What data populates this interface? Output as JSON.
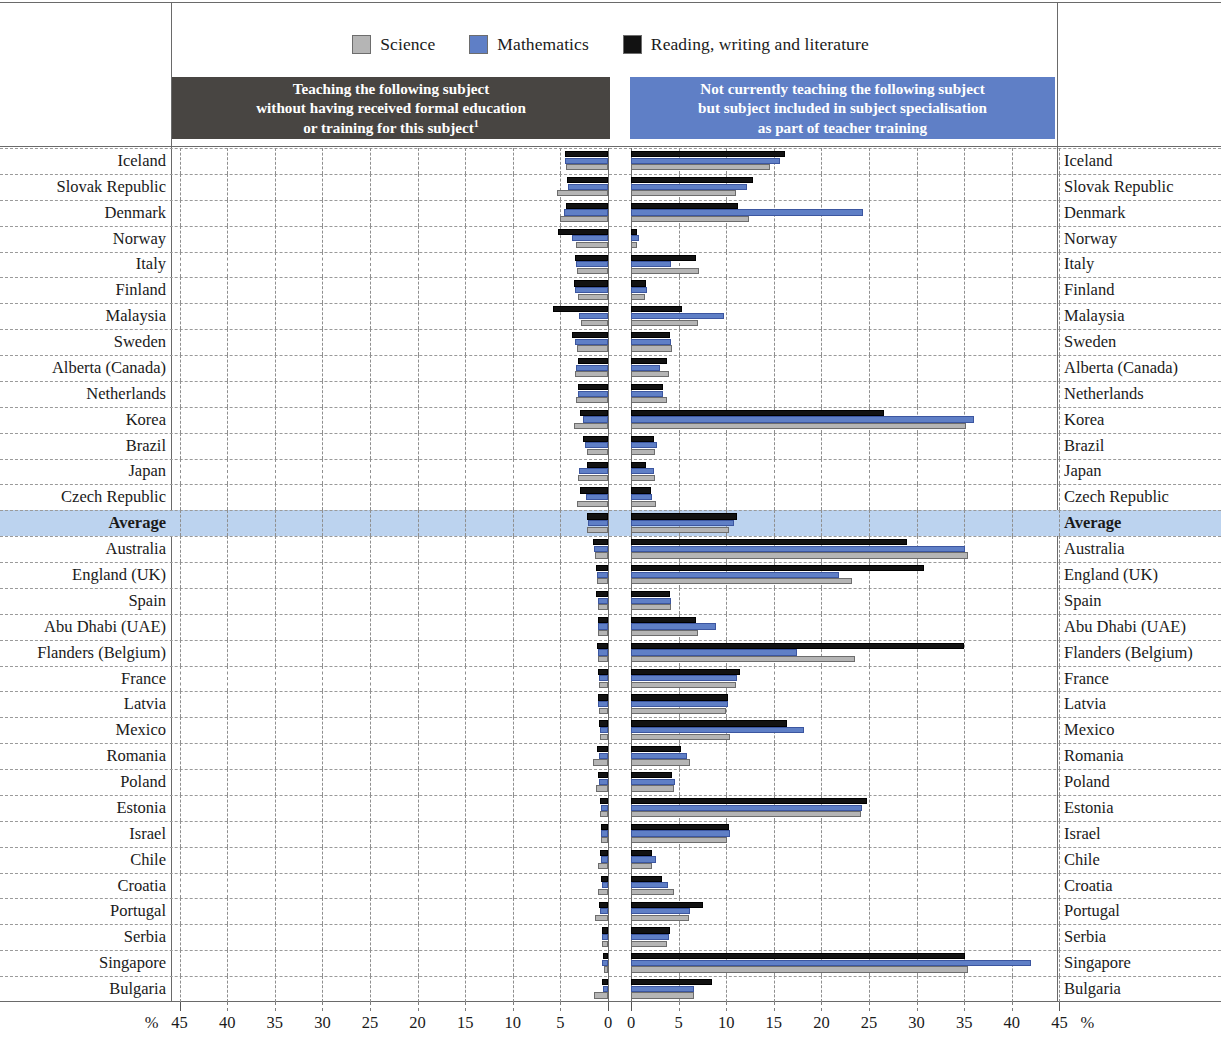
{
  "legend": {
    "items": [
      {
        "label": "Science",
        "color": "#b5b5b5",
        "key": "science"
      },
      {
        "label": "Mathematics",
        "color": "#5f7fc6",
        "key": "mathematics"
      },
      {
        "label": "Reading, writing and literature",
        "color": "#121212",
        "key": "reading"
      }
    ]
  },
  "panels": {
    "left": {
      "title_lines": [
        "Teaching the following subject",
        "without having received formal education",
        "or training for this subject"
      ],
      "footnote_marker": "1",
      "background": "#484542"
    },
    "right": {
      "title_lines": [
        "Not currently teaching the following subject",
        "but subject included in subject specialisation",
        "as part of teacher training"
      ],
      "background": "#5f7fc6"
    }
  },
  "axis": {
    "left_ticks": [
      45,
      40,
      35,
      30,
      25,
      20,
      15,
      10,
      5,
      0
    ],
    "right_ticks": [
      0,
      5,
      10,
      15,
      20,
      25,
      30,
      35,
      40,
      45
    ],
    "unit_label": "%",
    "max": 45,
    "left_zero_px": 608,
    "right_zero_px": 631,
    "px_per_unit": 9.52
  },
  "highlight_row": "Average",
  "chart_data": {
    "type": "bar",
    "orientation": "horizontal",
    "layout": "bidirectional-paired-panels",
    "xlabel": "%",
    "ylabel": "",
    "xlim": [
      0,
      45
    ],
    "grid": true,
    "legend_position": "top-center",
    "categories": [
      "Iceland",
      "Slovak Republic",
      "Denmark",
      "Norway",
      "Italy",
      "Finland",
      "Malaysia",
      "Sweden",
      "Alberta (Canada)",
      "Netherlands",
      "Korea",
      "Brazil",
      "Japan",
      "Czech Republic",
      "Average",
      "Australia",
      "England (UK)",
      "Spain",
      "Abu Dhabi (UAE)",
      "Flanders (Belgium)",
      "France",
      "Latvia",
      "Mexico",
      "Romania",
      "Poland",
      "Estonia",
      "Israel",
      "Chile",
      "Croatia",
      "Portugal",
      "Serbia",
      "Singapore",
      "Bulgaria"
    ],
    "series": [
      {
        "name": "Reading, writing and literature",
        "panel": "left",
        "color": "#121212",
        "values": [
          4.5,
          4.3,
          4.4,
          5.2,
          3.5,
          3.6,
          5.8,
          3.8,
          3.2,
          3.1,
          2.9,
          2.6,
          2.2,
          2.9,
          2.2,
          1.6,
          1.3,
          1.3,
          1.1,
          1.2,
          1.0,
          1.1,
          0.9,
          1.2,
          1.0,
          0.8,
          0.7,
          0.8,
          0.7,
          0.9,
          0.6,
          0.5,
          0.6
        ]
      },
      {
        "name": "Mathematics",
        "panel": "left",
        "color": "#5f7fc6",
        "values": [
          4.5,
          4.2,
          4.6,
          3.8,
          3.4,
          3.5,
          3.0,
          3.5,
          3.4,
          3.2,
          2.6,
          2.4,
          3.0,
          2.3,
          2.1,
          1.5,
          1.2,
          1.1,
          1.0,
          1.0,
          0.9,
          1.0,
          0.8,
          0.9,
          0.9,
          0.7,
          0.7,
          0.7,
          0.6,
          0.8,
          0.6,
          0.6,
          0.5
        ]
      },
      {
        "name": "Science",
        "panel": "left",
        "color": "#b5b5b5",
        "values": [
          4.4,
          5.4,
          5.0,
          3.4,
          3.3,
          3.2,
          2.8,
          3.3,
          3.5,
          3.4,
          3.6,
          2.2,
          3.1,
          3.3,
          2.2,
          1.4,
          1.2,
          1.0,
          1.0,
          1.1,
          0.9,
          0.9,
          0.8,
          1.6,
          1.3,
          0.8,
          0.7,
          1.0,
          1.0,
          1.4,
          0.6,
          0.4,
          1.5
        ]
      },
      {
        "name": "Reading, writing and literature",
        "panel": "right",
        "color": "#121212",
        "values": [
          16.2,
          12.8,
          11.2,
          0.6,
          6.8,
          1.6,
          5.4,
          4.1,
          3.8,
          3.4,
          26.6,
          2.4,
          1.6,
          2.1,
          11.1,
          29.0,
          30.8,
          4.1,
          6.8,
          35.0,
          11.4,
          10.2,
          16.4,
          5.2,
          4.3,
          24.8,
          10.3,
          2.2,
          3.3,
          7.6,
          4.1,
          35.1,
          8.5
        ]
      },
      {
        "name": "Mathematics",
        "panel": "right",
        "color": "#5f7fc6",
        "values": [
          15.6,
          12.2,
          24.4,
          0.8,
          4.2,
          1.7,
          9.8,
          4.2,
          3.0,
          3.4,
          36.0,
          2.7,
          2.4,
          2.2,
          10.8,
          35.1,
          21.9,
          4.2,
          8.9,
          17.4,
          11.1,
          10.2,
          18.2,
          5.9,
          4.6,
          24.3,
          10.4,
          2.6,
          3.9,
          6.2,
          4.0,
          42.0,
          6.6
        ]
      },
      {
        "name": "Science",
        "panel": "right",
        "color": "#b5b5b5",
        "values": [
          14.6,
          11.0,
          12.4,
          0.6,
          7.1,
          1.5,
          7.0,
          4.3,
          4.0,
          3.8,
          35.2,
          2.5,
          2.5,
          2.6,
          10.3,
          35.4,
          23.2,
          4.2,
          7.0,
          23.5,
          11.0,
          10.0,
          10.4,
          6.2,
          4.5,
          24.2,
          10.1,
          2.2,
          4.5,
          6.1,
          3.8,
          35.4,
          6.6
        ]
      }
    ]
  }
}
